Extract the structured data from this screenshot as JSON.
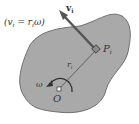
{
  "diagram": {
    "equation": "(v",
    "equation_sub": "i",
    "equation_mid": " = r",
    "equation_sub2": "i",
    "equation_end": "ω)",
    "velocity_label": "v",
    "velocity_sub": "i",
    "point_label": "P",
    "point_sub": "i",
    "radius_label": "r",
    "radius_sub": "i",
    "omega_label": "ω",
    "origin_label": "O",
    "colors": {
      "body_fill": "#a9a9a9",
      "body_stroke": "#6e6e6e",
      "arrow": "#555555",
      "text": "#333333"
    }
  }
}
